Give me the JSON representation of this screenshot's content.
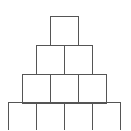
{
  "diagram": {
    "title": "",
    "type": "block-pyramid",
    "stroke_color": "#555555",
    "background": "#ffffff",
    "rows": [
      {
        "count": 1,
        "y": 16,
        "x_start": 50
      },
      {
        "count": 2,
        "y": 45,
        "x_start": 36
      },
      {
        "count": 3,
        "y": 74,
        "x_start": 22
      },
      {
        "count": 4,
        "y": 102,
        "x_start": 8
      }
    ],
    "block_width": 28,
    "block_height": 29
  }
}
